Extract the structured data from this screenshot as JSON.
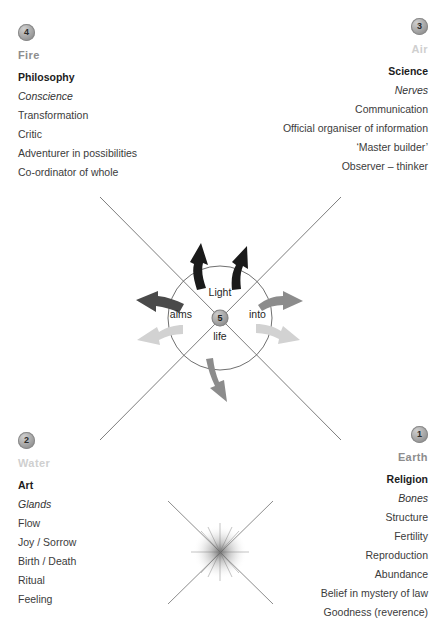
{
  "diagram": {
    "center": {
      "badge_number": "5",
      "word_top": "Light",
      "word_left": "aims",
      "word_right": "into",
      "word_bottom": "life"
    },
    "colors": {
      "text": "#3b3b3b",
      "heading": "#1c1c1c",
      "element_mid": "#8d8d8d",
      "element_light": "#cfcfcf",
      "arrow_black": "#1a1a1a",
      "arrow_dark": "#4a4a4a",
      "arrow_mid": "#8c8c8c",
      "arrow_light": "#d2d2d2",
      "line": "#6e6e6e",
      "circle": "#5f5f5f"
    },
    "quadrants": [
      {
        "position": "top-left",
        "badge_number": "4",
        "element": "Fire",
        "element_tone": "mid",
        "heading": "Philosophy",
        "subheading": "Conscience",
        "items": [
          "Transformation",
          "Critic",
          "Adventurer in possibilities",
          "Co-ordinator of whole"
        ]
      },
      {
        "position": "top-right",
        "badge_number": "3",
        "element": "Air",
        "element_tone": "light",
        "heading": "Science",
        "subheading": "Nerves",
        "items": [
          "Communication",
          "Official organiser of information",
          "‘Master builder’",
          "Observer – thinker"
        ]
      },
      {
        "position": "bottom-left",
        "badge_number": "2",
        "element": "Water",
        "element_tone": "light",
        "heading": "Art",
        "subheading": "Glands",
        "items": [
          "Flow",
          "Joy / Sorrow",
          "Birth / Death",
          "Ritual",
          "Feeling"
        ]
      },
      {
        "position": "bottom-right",
        "badge_number": "1",
        "element": "Earth",
        "element_tone": "mid",
        "heading": "Religion",
        "subheading": "Bones",
        "items": [
          "Structure",
          "Fertility",
          "Reproduction",
          "Abundance",
          "Belief in mystery of law",
          "Goodness (reverence)"
        ]
      }
    ],
    "arrows": [
      {
        "name": "top-left-up",
        "tone": "black"
      },
      {
        "name": "top-right-up",
        "tone": "black"
      },
      {
        "name": "right-upper",
        "tone": "mid"
      },
      {
        "name": "right-lower",
        "tone": "light"
      },
      {
        "name": "bottom-down",
        "tone": "mid"
      },
      {
        "name": "left-lower",
        "tone": "light"
      },
      {
        "name": "left-upper",
        "tone": "dark"
      }
    ],
    "starburst": {
      "name": "radial-starburst"
    }
  }
}
